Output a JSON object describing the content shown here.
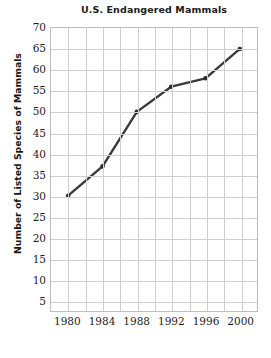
{
  "chart_data": {
    "type": "line",
    "title": "U.S. Endangered Mammals",
    "xlabel": "",
    "ylabel": "Number of Listed Species of Mammals",
    "categories": [
      "1980",
      "1984",
      "1988",
      "1992",
      "1996",
      "2000"
    ],
    "x": [
      1980,
      1984,
      1988,
      1992,
      1996,
      2000
    ],
    "values": [
      30,
      37,
      50,
      56,
      58,
      65
    ],
    "series": [
      {
        "name": "Listed Species of Mammals",
        "values": [
          30,
          37,
          50,
          56,
          58,
          65
        ]
      }
    ],
    "ylim": [
      0,
      70
    ],
    "xlim": [
      1978,
      2002
    ],
    "ytick_labels": [
      "70",
      "65",
      "60",
      "55",
      "50",
      "45",
      "40",
      "35",
      "30",
      "25",
      "20",
      "15",
      "10",
      "5"
    ],
    "ytick_values": [
      70,
      65,
      60,
      55,
      50,
      45,
      40,
      35,
      30,
      25,
      20,
      15,
      10,
      5
    ],
    "ytick_step": 5,
    "xtick_labels": [
      "1980",
      "1984",
      "1988",
      "1992",
      "1996",
      "2000"
    ],
    "x_minor_step": 2,
    "grid": true,
    "grid_color": "#cfcfcf",
    "legend": false,
    "line_color": "#3a3a3a",
    "marker": "circle",
    "marker_color": "#2b2b2b",
    "background": "#ffffff"
  }
}
